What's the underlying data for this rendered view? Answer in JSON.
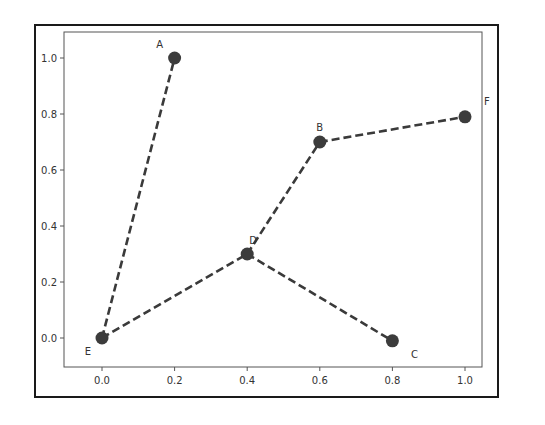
{
  "chart_data": {
    "type": "line",
    "subtype": "network-graph",
    "title": "",
    "xlabel": "",
    "ylabel": "",
    "xlim": [
      -0.1,
      1.1
    ],
    "ylim": [
      -0.1,
      1.1
    ],
    "grid": false,
    "legend": null,
    "x_ticks": [
      "0.0",
      "0.2",
      "0.4",
      "0.6",
      "0.8",
      "1.0"
    ],
    "y_ticks": [
      "0.0",
      "0.2",
      "0.4",
      "0.6",
      "0.8",
      "1.0"
    ],
    "nodes": [
      {
        "label": "A",
        "x": 0.2,
        "y": 1.0
      },
      {
        "label": "B",
        "x": 0.6,
        "y": 0.7
      },
      {
        "label": "C",
        "x": 0.8,
        "y": -0.01
      },
      {
        "label": "D",
        "x": 0.4,
        "y": 0.3
      },
      {
        "label": "E",
        "x": 0.0,
        "y": 0.0
      },
      {
        "label": "F",
        "x": 1.0,
        "y": 0.79
      }
    ],
    "edges": [
      [
        "E",
        "A"
      ],
      [
        "E",
        "D"
      ],
      [
        "D",
        "B"
      ],
      [
        "B",
        "F"
      ],
      [
        "D",
        "C"
      ]
    ],
    "style": {
      "line": "dashed",
      "line_color": "#3a3a3a",
      "marker": "circle",
      "marker_color": "#3c3c3c"
    }
  }
}
